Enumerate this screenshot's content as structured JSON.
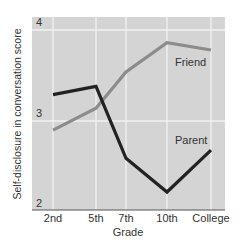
{
  "chart_data": {
    "type": "line",
    "title": "",
    "xlabel": "Grade",
    "ylabel": "Self-disclosure in conversation score",
    "categories": [
      "2nd",
      "5th",
      "7th",
      "10th",
      "College"
    ],
    "ylim": [
      2,
      4
    ],
    "yticks": [
      "2",
      "3",
      "4"
    ],
    "grid": true,
    "legend": "inline labels",
    "series": [
      {
        "name": "Parent",
        "color": "#222222",
        "values": [
          3.29,
          3.38,
          2.59,
          2.22,
          2.68
        ]
      },
      {
        "name": "Friend",
        "color": "#8c8c8c",
        "values": [
          2.9,
          3.14,
          3.54,
          3.86,
          3.78
        ]
      }
    ]
  },
  "colors": {
    "plot_background": "#d4d4d4",
    "grid": "#f2f2f2",
    "axis": "#555555"
  }
}
